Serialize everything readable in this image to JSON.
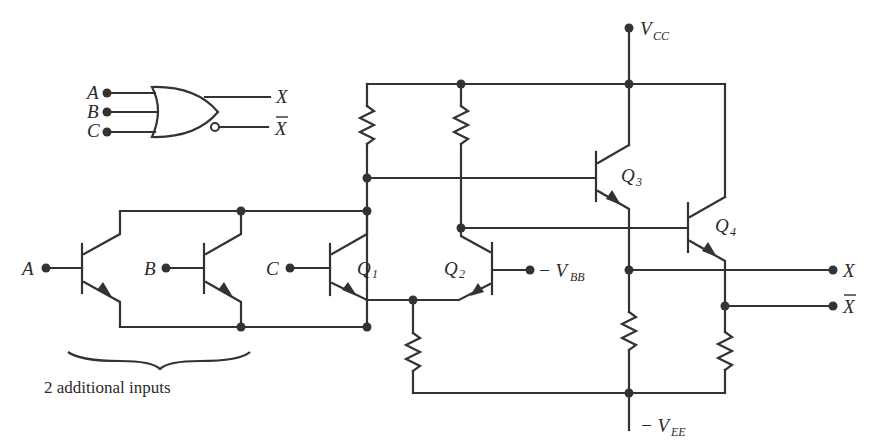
{
  "diagram": {
    "colors": {
      "ink": "#333333",
      "background": "#ffffff"
    },
    "logic_symbol": {
      "gate": "OR/NOR",
      "inputs": [
        "A",
        "B",
        "C"
      ],
      "outputs": [
        "X",
        "X̄"
      ]
    },
    "labels": {
      "vcc": "V",
      "vcc_sub": "CC",
      "vbb_prefix": "− V",
      "vbb_sub": "BB",
      "vee_prefix": "− V",
      "vee_sub": "EE",
      "input_a": "A",
      "input_b": "B",
      "input_c": "C",
      "output_x": "X",
      "output_xbar": "X",
      "q1": "Q",
      "q1_sub": "1",
      "q2": "Q",
      "q2_sub": "2",
      "q3": "Q",
      "q3_sub": "3",
      "q4": "Q",
      "q4_sub": "4",
      "additional_inputs": "2 additional inputs"
    },
    "components": {
      "transistors": [
        "Q_A",
        "Q_B",
        "Q1",
        "Q2",
        "Q3",
        "Q4"
      ],
      "resistors": [
        "R_C1",
        "R_C2",
        "R_E",
        "R_3",
        "R_4"
      ]
    }
  }
}
